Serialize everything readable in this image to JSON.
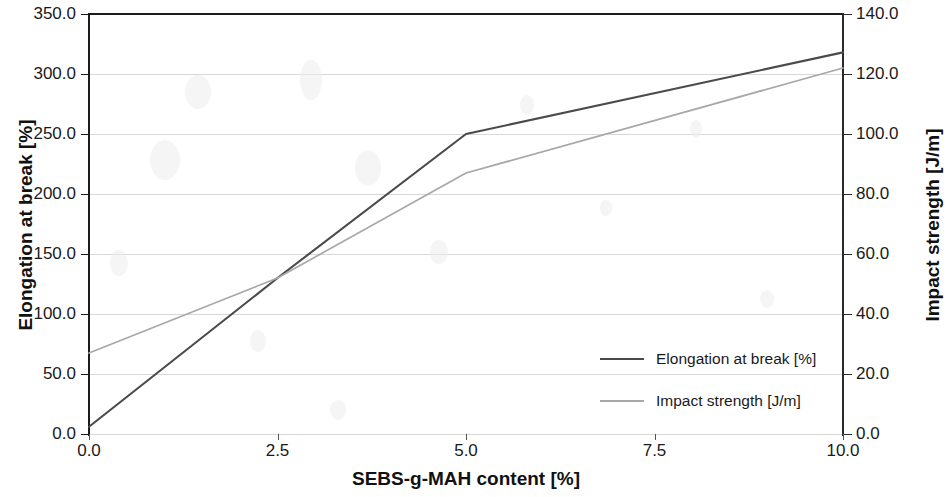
{
  "chart_data": {
    "type": "line",
    "title": "",
    "xlabel": "SEBS-g-MAH content [%]",
    "ylabel": "Elongation at break [%]",
    "y2label": "Impact strength [J/m]",
    "x": [
      0.0,
      2.5,
      5.0,
      10.0
    ],
    "xlim": [
      0.0,
      10.0
    ],
    "ylim": [
      0.0,
      350.0
    ],
    "y2lim": [
      0.0,
      140.0
    ],
    "xticks": [
      "0.0",
      "2.5",
      "5.0",
      "7.5",
      "10.0"
    ],
    "xtick_values": [
      0.0,
      2.5,
      5.0,
      7.5,
      10.0
    ],
    "yticks": [
      "0.0",
      "50.0",
      "100.0",
      "150.0",
      "200.0",
      "250.0",
      "300.0",
      "350.0"
    ],
    "ytick_values": [
      0,
      50,
      100,
      150,
      200,
      250,
      300,
      350
    ],
    "y2ticks": [
      "0.0",
      "20.0",
      "40.0",
      "60.0",
      "80.0",
      "100.0",
      "120.0",
      "140.0"
    ],
    "y2tick_values": [
      0,
      20,
      40,
      60,
      80,
      100,
      120,
      140
    ],
    "grid": true,
    "legend_position": "center-right",
    "series": [
      {
        "name": "Elongation at break [%]",
        "axis": "left",
        "color": "#4a4a4a",
        "x": [
          0.0,
          2.5,
          5.0,
          10.0
        ],
        "values": [
          6,
          130,
          250,
          318
        ]
      },
      {
        "name": "Impact strength [J/m]",
        "axis": "right",
        "color": "#a8a8a8",
        "x": [
          0.0,
          2.5,
          5.0,
          10.0
        ],
        "values": [
          27,
          52,
          87,
          122
        ]
      }
    ]
  },
  "axes": {
    "x_title": "SEBS-g-MAH content [%]",
    "y_left_title": "Elongation at break [%]",
    "y_right_title": "Impact strength [J/m]"
  },
  "legend": {
    "items": [
      {
        "label": "Elongation at break [%]",
        "color": "#4a4a4a"
      },
      {
        "label": "Impact strength [J/m]",
        "color": "#a8a8a8"
      }
    ]
  }
}
